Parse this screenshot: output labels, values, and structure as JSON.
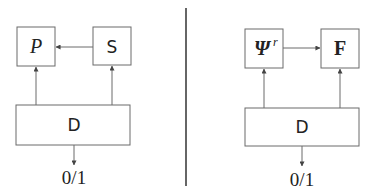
{
  "left_panel": {
    "box_p": {
      "label": "P"
    },
    "box_s": {
      "label": "S"
    },
    "box_d": {
      "label": "D"
    },
    "output": {
      "label": "0/1"
    },
    "edges": [
      {
        "from": "S",
        "to": "P"
      },
      {
        "from": "D",
        "to": "P"
      },
      {
        "from": "D",
        "to": "S"
      },
      {
        "from": "D",
        "to": "0/1"
      }
    ]
  },
  "right_panel": {
    "box_psi": {
      "label": "Ψ",
      "superscript": "r"
    },
    "box_f": {
      "label": "F"
    },
    "box_d": {
      "label": "D"
    },
    "output": {
      "label": "0/1"
    },
    "edges": [
      {
        "from": "Ψ^r",
        "to": "F"
      },
      {
        "from": "D",
        "to": "Ψ^r"
      },
      {
        "from": "D",
        "to": "F"
      },
      {
        "from": "D",
        "to": "0/1"
      }
    ]
  }
}
